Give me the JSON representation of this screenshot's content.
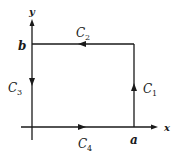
{
  "diagram": {
    "type": "closed rectangular contour on xy-plane",
    "colors": {
      "stroke": "#1a1a1a",
      "background": "#ffffff"
    },
    "axes": {
      "x_label": "x",
      "y_label": "y"
    },
    "points": {
      "a_label": "a",
      "b_label": "b"
    },
    "segments": [
      {
        "id": "C1",
        "letter": "C",
        "sub": "1",
        "from": "(a,0)",
        "to": "(a,b)",
        "direction": "up"
      },
      {
        "id": "C2",
        "letter": "C",
        "sub": "2",
        "from": "(a,b)",
        "to": "(0,b)",
        "direction": "left"
      },
      {
        "id": "C3",
        "letter": "C",
        "sub": "3",
        "from": "(0,b)",
        "to": "(0,0)",
        "direction": "down"
      },
      {
        "id": "C4",
        "letter": "C",
        "sub": "4",
        "from": "(0,0)",
        "to": "(a,0)",
        "direction": "right"
      }
    ]
  }
}
